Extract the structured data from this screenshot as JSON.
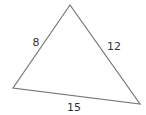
{
  "diagram": {
    "shape": "triangle",
    "vertices": {
      "top": [
        70,
        5
      ],
      "left": [
        13,
        88
      ],
      "right": [
        140,
        104
      ]
    },
    "stroke_color": "#777777",
    "sides": [
      {
        "name": "left",
        "label": "8",
        "pos": [
          36,
          46
        ]
      },
      {
        "name": "right",
        "label": "12",
        "pos": [
          114,
          50
        ]
      },
      {
        "name": "bottom",
        "label": "15",
        "pos": [
          74,
          111
        ]
      }
    ]
  }
}
